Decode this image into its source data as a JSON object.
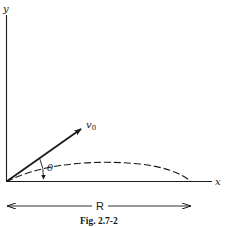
{
  "figure": {
    "caption": "Fig. 2.7-2",
    "axes": {
      "x_label": "x",
      "y_label": "y"
    },
    "vector": {
      "label": "v",
      "subscript": "0"
    },
    "angle": {
      "label": "θ"
    },
    "range": {
      "label": "R"
    },
    "colors": {
      "ink": "#1a1a1a",
      "background": "#ffffff"
    }
  }
}
